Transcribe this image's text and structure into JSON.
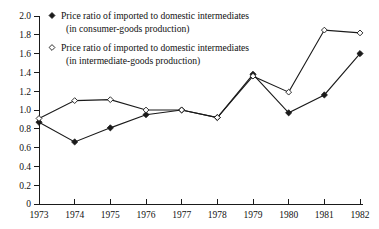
{
  "chart_data": {
    "type": "line",
    "title": "",
    "xlabel": "",
    "ylabel": "",
    "categories": [
      "1973",
      "1974",
      "1975",
      "1976",
      "1977",
      "1978",
      "1979",
      "1980",
      "1981",
      "1982"
    ],
    "x": [
      1973,
      1974,
      1975,
      1976,
      1977,
      1978,
      1979,
      1980,
      1981,
      1982
    ],
    "ylim": [
      0,
      2.0
    ],
    "yticks": [
      "0",
      "0.2",
      "0.4",
      "0.6",
      "0.8",
      "1.0",
      "1.2",
      "1.4",
      "1.6",
      "1.8",
      "2.0"
    ],
    "ytick_values": [
      0,
      0.2,
      0.4,
      0.6,
      0.8,
      1.0,
      1.2,
      1.4,
      1.6,
      1.8,
      2.0
    ],
    "grid": false,
    "legend_position": "top-left-inside",
    "series": [
      {
        "name": "Price ratio of imported to domestic intermediates (in consumer-goods production)",
        "name_line1": "Price ratio of imported to domestic intermediates",
        "name_line2": "(in consumer-goods production)",
        "marker": "filled-diamond",
        "values": [
          0.87,
          0.66,
          0.81,
          0.95,
          1.0,
          0.92,
          1.38,
          0.97,
          1.16,
          1.6
        ]
      },
      {
        "name": "Price ratio of imported to domestic intermediates (in intermediate-goods production)",
        "name_line1": "Price ratio of imported to domestic intermediates",
        "name_line2": "(in intermediate-goods production)",
        "marker": "open-diamond",
        "values": [
          0.91,
          1.1,
          1.11,
          1.0,
          1.0,
          0.92,
          1.36,
          1.19,
          1.85,
          1.82
        ]
      }
    ]
  },
  "legend": {
    "entry1": {
      "marker_name": "filled-diamond-marker",
      "line1": "Price ratio of imported to domestic intermediates",
      "line2": "(in consumer-goods production)"
    },
    "entry2": {
      "marker_name": "open-diamond-marker",
      "line1": "Price ratio of imported to domestic intermediates",
      "line2": "(in intermediate-goods production)"
    }
  },
  "colors": {
    "ink": "#1a1a1a",
    "background": "#ffffff"
  }
}
